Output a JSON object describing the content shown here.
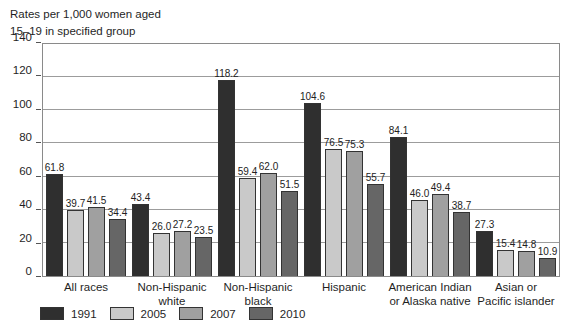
{
  "title": {
    "line1": "Rates per 1,000 women aged",
    "line2": "15–19 in specified group"
  },
  "chart_data": {
    "type": "bar",
    "title": "Rates per 1,000 women aged 15–19 in specified group",
    "ylabel": "Rates per 1,000 women aged 15–19 in specified group",
    "xlabel": "",
    "categories": [
      "All races",
      "Non-Hispanic white",
      "Non-Hispanic black",
      "Hispanic",
      "American Indian or Alaska native",
      "Asian or Pacific islander"
    ],
    "category_lines": [
      [
        "All races"
      ],
      [
        "Non-Hispanic",
        "white"
      ],
      [
        "Non-Hispanic",
        "black"
      ],
      [
        "Hispanic"
      ],
      [
        "American Indian",
        "or Alaska native"
      ],
      [
        "Asian or",
        "Pacific islander"
      ]
    ],
    "series": [
      {
        "name": "1991",
        "color": "#2f2f2f",
        "values": [
          61.8,
          43.4,
          118.2,
          104.6,
          84.1,
          27.3
        ]
      },
      {
        "name": "2005",
        "color": "#c9c9c9",
        "values": [
          39.7,
          26.0,
          59.4,
          76.5,
          46.0,
          15.4
        ]
      },
      {
        "name": "2007",
        "color": "#a0a0a0",
        "values": [
          41.5,
          27.2,
          62.0,
          75.3,
          49.4,
          14.8
        ]
      },
      {
        "name": "2010",
        "color": "#666666",
        "values": [
          34.4,
          23.5,
          51.5,
          55.7,
          38.7,
          10.9
        ]
      }
    ],
    "ylim": [
      0,
      140
    ],
    "yticks": [
      0,
      20,
      40,
      60,
      80,
      100,
      120,
      140
    ],
    "grid": true,
    "value_labels": true,
    "legend_position": "bottom-left",
    "legend_entries": [
      "1991",
      "2005",
      "2007",
      "2010"
    ]
  }
}
